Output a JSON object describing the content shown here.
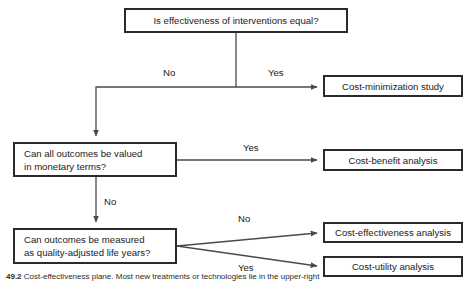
{
  "figure": {
    "caption_number": "49.2",
    "caption_text": "Cost-effectiveness plane. Most new treatments or technologies lie in the upper-right",
    "colors": {
      "background": "#ffffff",
      "box_border": "#2b2b2b",
      "box_fill": "#ffffff",
      "text": "#1a1a1a",
      "connector": "#4a4a4a"
    }
  },
  "nodes": {
    "q1": {
      "label": "Is effectiveness of interventions equal?"
    },
    "q2_line1": {
      "label": "Can all outcomes be valued"
    },
    "q2_line2": {
      "label": "in monetary terms?"
    },
    "q3_line1": {
      "label": "Can outcomes be measured"
    },
    "q3_line2": {
      "label": "as quality-adjusted life years?"
    },
    "r1": {
      "label": "Cost-minimization study"
    },
    "r2": {
      "label": "Cost-benefit analysis"
    },
    "r3": {
      "label": "Cost-effectiveness analysis"
    },
    "r4": {
      "label": "Cost-utility analysis"
    }
  },
  "edge_labels": {
    "q1_no": "No",
    "q1_yes": "Yes",
    "q2_yes": "Yes",
    "q2_no": "No",
    "q3_no": "No",
    "q3_yes": "Yes"
  }
}
